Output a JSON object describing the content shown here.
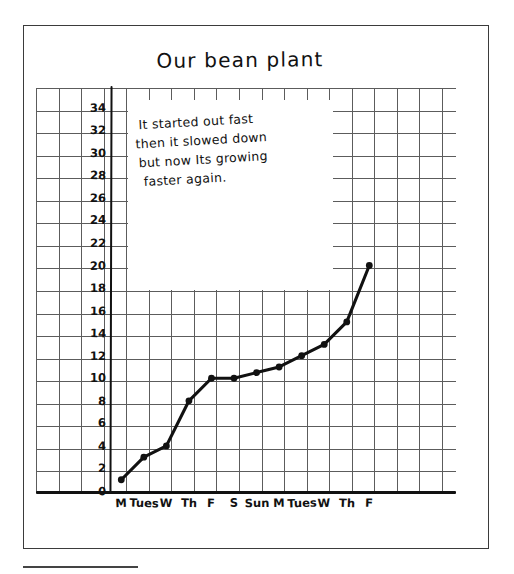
{
  "page": {
    "title": "Our bean plant",
    "note": {
      "lines": [
        "It started out fast",
        "then it slowed down",
        "but now Its growing",
        "faster again."
      ]
    }
  },
  "chart_data": {
    "type": "line",
    "title": "Our bean plant",
    "xlabel": "",
    "ylabel": "",
    "categories": [
      "M",
      "Tues",
      "W",
      "Th",
      "F",
      "S",
      "Sun",
      "M",
      "Tues",
      "W",
      "Th",
      "F"
    ],
    "values": [
      1,
      3,
      4,
      8,
      10,
      10,
      10.5,
      11,
      12,
      13,
      15,
      20
    ],
    "ylim": [
      0,
      34
    ],
    "ytick_labels": [
      "34",
      "32",
      "30",
      "28",
      "26",
      "24",
      "22",
      "20",
      "18",
      "16",
      "14",
      "12",
      "10",
      "8",
      "6",
      "4",
      "2",
      "0"
    ],
    "ytick_values": [
      34,
      32,
      30,
      28,
      26,
      24,
      22,
      20,
      18,
      16,
      14,
      12,
      10,
      8,
      6,
      4,
      2,
      0
    ],
    "grid": true,
    "legend": "none",
    "annotations": [
      "It started out fast then it slowed down but now Its growing faster again."
    ],
    "style": "hand-drawn on graph paper",
    "line_color": "#111111",
    "marker": "filled-circle"
  },
  "colors": {
    "ink": "#111111",
    "grid": "#5c5c5c",
    "page_border": "#3b3b3b",
    "paper": "#ffffff"
  }
}
